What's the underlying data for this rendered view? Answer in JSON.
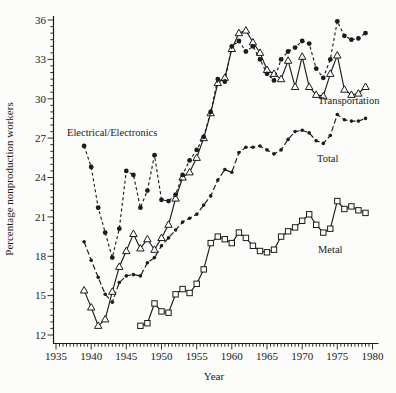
{
  "figure": {
    "background": "#fcfcfa",
    "ink": "#1c1c1c"
  },
  "chart_data": {
    "type": "line",
    "title": "",
    "xlabel": "Year",
    "ylabel": "Percentage nonproduction workers",
    "xlim": [
      1935,
      1980
    ],
    "ylim": [
      12,
      36
    ],
    "grid": false,
    "x_ticks": [
      1935,
      1940,
      1945,
      1950,
      1955,
      1960,
      1965,
      1970,
      1975,
      1980
    ],
    "y_ticks": [
      12,
      15,
      18,
      21,
      24,
      27,
      30,
      33,
      36
    ],
    "legend_position": "inline-labels",
    "series": [
      {
        "id": "total",
        "label": "Total",
        "marker": "small-dot",
        "line_style": "long-dash",
        "label_x": 317,
        "label_y": 162,
        "years": [
          1939,
          1940,
          1941,
          1942,
          1943,
          1944,
          1945,
          1946,
          1947,
          1948,
          1949,
          1950,
          1951,
          1952,
          1953,
          1954,
          1955,
          1956,
          1957,
          1958,
          1959,
          1960,
          1961,
          1962,
          1963,
          1964,
          1965,
          1966,
          1967,
          1968,
          1969,
          1970,
          1971,
          1972,
          1973,
          1974,
          1975,
          1976,
          1977,
          1978,
          1979
        ],
        "values": [
          19.1,
          17.7,
          16.4,
          15.1,
          14.5,
          16.0,
          16.5,
          16.6,
          16.5,
          17.5,
          17.9,
          18.8,
          19.4,
          20.0,
          20.6,
          20.9,
          21.2,
          21.9,
          22.6,
          23.8,
          24.6,
          24.4,
          25.9,
          26.3,
          26.3,
          26.4,
          26.1,
          25.8,
          26.1,
          26.9,
          27.5,
          27.6,
          27.4,
          26.8,
          26.6,
          27.2,
          28.8,
          28.4,
          28.3,
          28.3,
          28.5
        ]
      },
      {
        "id": "metal",
        "label": "Metal",
        "marker": "open-square",
        "line_style": "solid",
        "label_x": 318,
        "label_y": 253,
        "years": [
          1947,
          1948,
          1949,
          1950,
          1951,
          1952,
          1953,
          1954,
          1955,
          1956,
          1957,
          1958,
          1959,
          1960,
          1961,
          1962,
          1963,
          1964,
          1965,
          1966,
          1967,
          1968,
          1969,
          1970,
          1971,
          1972,
          1973,
          1974,
          1975,
          1976,
          1977,
          1978,
          1979
        ],
        "values": [
          12.7,
          12.9,
          14.4,
          13.8,
          13.7,
          15.1,
          15.5,
          15.2,
          15.9,
          17.0,
          19.0,
          19.5,
          19.3,
          19.0,
          19.8,
          19.4,
          18.8,
          18.4,
          18.3,
          18.5,
          19.5,
          19.9,
          20.2,
          20.7,
          21.2,
          20.4,
          19.8,
          20.1,
          22.2,
          21.6,
          21.8,
          21.5,
          21.3
        ]
      },
      {
        "id": "transportation",
        "label": "Transportation",
        "marker": "open-triangle",
        "line_style": "solid",
        "label_x": 318,
        "label_y": 104,
        "years": [
          1939,
          1940,
          1941,
          1942,
          1943,
          1944,
          1945,
          1946,
          1947,
          1948,
          1949,
          1950,
          1951,
          1952,
          1953,
          1954,
          1955,
          1956,
          1957,
          1958,
          1959,
          1960,
          1961,
          1962,
          1963,
          1964,
          1965,
          1966,
          1967,
          1968,
          1969,
          1970,
          1971,
          1972,
          1973,
          1974,
          1975,
          1976,
          1977,
          1978,
          1979
        ],
        "values": [
          15.4,
          14.1,
          12.7,
          13.2,
          15.3,
          17.2,
          18.4,
          19.7,
          18.6,
          19.3,
          18.5,
          19.4,
          20.4,
          22.4,
          24.0,
          24.4,
          25.5,
          27.0,
          28.9,
          31.2,
          31.6,
          33.8,
          35.0,
          35.2,
          34.3,
          33.5,
          32.2,
          31.9,
          31.5,
          32.9,
          30.9,
          33.2,
          30.9,
          30.3,
          30.2,
          31.9,
          33.3,
          30.7,
          30.3,
          30.4,
          30.9
        ]
      },
      {
        "id": "electrical-electronics",
        "label": "Electrical/Electronics",
        "marker": "filled-circle",
        "line_style": "short-dash",
        "label_x": 67,
        "label_y": 136,
        "years": [
          1939,
          1940,
          1941,
          1942,
          1943,
          1944,
          1945,
          1946,
          1947,
          1948,
          1949,
          1950,
          1951,
          1952,
          1953,
          1954,
          1955,
          1956,
          1957,
          1958,
          1959,
          1960,
          1961,
          1962,
          1963,
          1964,
          1965,
          1966,
          1967,
          1968,
          1969,
          1970,
          1971,
          1972,
          1973,
          1974,
          1975,
          1976,
          1977,
          1978,
          1979
        ],
        "values": [
          26.4,
          24.8,
          21.7,
          19.8,
          17.9,
          20.1,
          24.5,
          24.2,
          21.7,
          23.0,
          25.7,
          22.3,
          22.2,
          22.7,
          24.2,
          25.3,
          26.1,
          27.1,
          29.0,
          31.5,
          31.3,
          34.0,
          34.4,
          33.6,
          34.0,
          33.0,
          31.9,
          31.4,
          33.0,
          33.6,
          33.9,
          34.4,
          34.2,
          32.3,
          31.6,
          33.0,
          35.9,
          34.8,
          34.5,
          34.6,
          35.0
        ]
      }
    ]
  }
}
